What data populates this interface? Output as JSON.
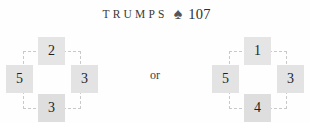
{
  "header": {
    "title": "TRUMPS",
    "suit_icon": "spade-icon",
    "suit_glyph": "♠",
    "number": "107",
    "suit_color": "#555558",
    "text_color": "#2f2f2f"
  },
  "separator": {
    "label": "or"
  },
  "diagrams": [
    {
      "name": "left",
      "tiles": {
        "top": "2",
        "left": "5",
        "right": "3",
        "bottom": "3"
      }
    },
    {
      "name": "right",
      "tiles": {
        "top": "1",
        "left": "5",
        "right": "3",
        "bottom": "4"
      }
    }
  ],
  "style": {
    "tile_fill": "#e3e3e3",
    "dash_color": "#c9c9c9",
    "background": "#fefefe"
  }
}
